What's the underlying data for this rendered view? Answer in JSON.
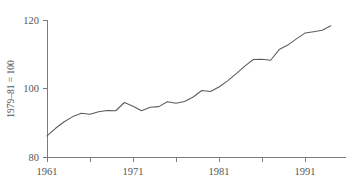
{
  "chart_data": {
    "type": "line",
    "title": "",
    "subtitle": "",
    "xlabel": "",
    "ylabel": "1979–81 = 100",
    "xlim": [
      1961,
      1995
    ],
    "ylim": [
      80,
      120
    ],
    "grid": false,
    "legend": null,
    "y_ticks": [
      80,
      100,
      120
    ],
    "y_tick_labels": [
      "80",
      "100",
      "120"
    ],
    "x_ticks": [
      1961,
      1966,
      1971,
      1976,
      1981,
      1986,
      1991
    ],
    "x_tick_labels": [
      "1961",
      "",
      "1971",
      "",
      "1981",
      "",
      "1991"
    ],
    "x_major_labels": [
      "1961",
      "1971",
      "1981",
      "1991"
    ],
    "series": [
      {
        "name": "index",
        "x": [
          1961,
          1962,
          1963,
          1964,
          1965,
          1966,
          1967,
          1968,
          1969,
          1970,
          1971,
          1972,
          1973,
          1974,
          1975,
          1976,
          1977,
          1978,
          1979,
          1980,
          1981,
          1982,
          1983,
          1984,
          1985,
          1986,
          1987,
          1988,
          1989,
          1990,
          1991,
          1992,
          1993,
          1994
        ],
        "values": [
          86.3,
          88.5,
          90.4,
          91.9,
          92.9,
          92.6,
          93.3,
          93.7,
          93.6,
          96.0,
          94.9,
          93.6,
          94.6,
          94.8,
          96.2,
          95.8,
          96.3,
          97.6,
          99.5,
          99.2,
          100.5,
          102.3,
          104.4,
          106.6,
          108.5,
          108.6,
          108.3,
          111.4,
          112.7,
          114.5,
          116.2,
          116.6,
          117.0,
          118.3
        ]
      }
    ]
  },
  "axes": {
    "y_axis_label": "1979–81 = 100",
    "y_top_label": "120",
    "y_mid_label": "100",
    "y_bottom_label": "80",
    "x_label_1": "1961",
    "x_label_2": "1971",
    "x_label_3": "1981",
    "x_label_4": "1991"
  },
  "colors": {
    "line": "#5c5c5c",
    "axis": "#6e6e6e",
    "text": "#565656",
    "background": "#ffffff"
  }
}
